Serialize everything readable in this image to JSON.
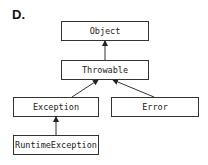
{
  "figure": {
    "label": "D."
  },
  "nodes": {
    "object": "Object",
    "throwable": "Throwable",
    "exception": "Exception",
    "error": "Error",
    "runtime_exception": "RuntimeException"
  },
  "edges": [
    {
      "from": "Throwable",
      "to": "Object"
    },
    {
      "from": "Exception",
      "to": "Throwable"
    },
    {
      "from": "Error",
      "to": "Throwable"
    },
    {
      "from": "RuntimeException",
      "to": "Exception"
    }
  ],
  "colors": {
    "stroke": "#333333",
    "background": "#ffffff"
  }
}
